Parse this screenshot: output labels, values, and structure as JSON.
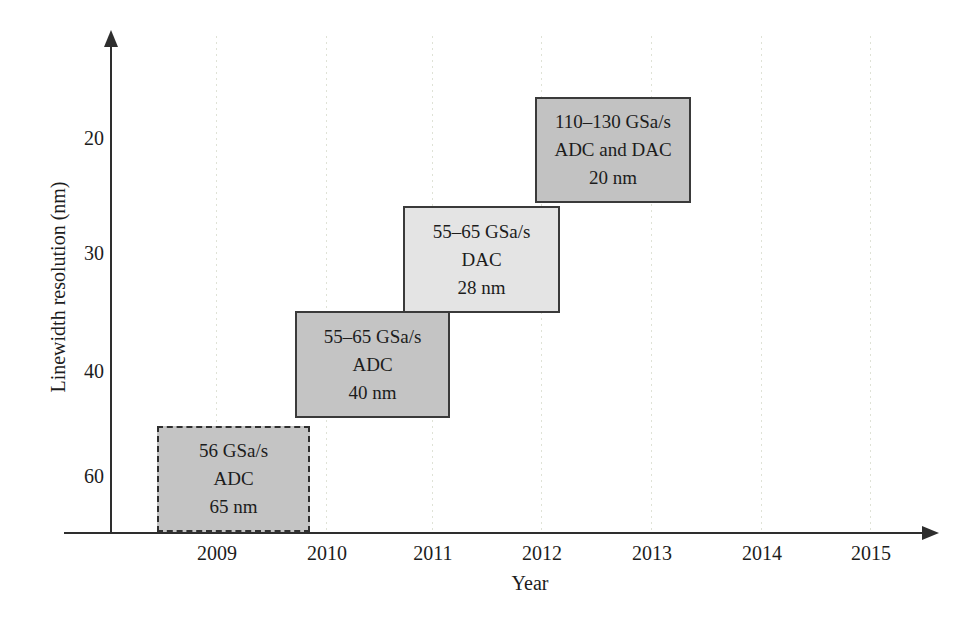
{
  "chart_data": {
    "type": "bar",
    "variant": "technology-roadmap-boxes",
    "title": "",
    "xlabel": "Year",
    "ylabel": "Linewidth resolution (nm)",
    "x_ticks": [
      "2009",
      "2010",
      "2011",
      "2012",
      "2013",
      "2014",
      "2015"
    ],
    "y_ticks": [
      "20",
      "30",
      "40",
      "60"
    ],
    "x_range": [
      2008.1,
      2015.6
    ],
    "y_axis_inverted": true,
    "grid": "faint dotted vertical gridline at each year tick",
    "boxes": [
      {
        "label_lines": [
          "56 GSa/s",
          "ADC",
          "65 nm"
        ],
        "sample_rate": "56 GSa/s",
        "converter": "ADC",
        "cmos_node_nm": 65,
        "year_span": [
          2008.45,
          2009.85
        ],
        "linewidth_span_nm": [
          45,
          66
        ],
        "border_style": "dashed",
        "fill": "#c4c4c4"
      },
      {
        "label_lines": [
          "55–65 GSa/s",
          "ADC",
          "40 nm"
        ],
        "sample_rate": "55–65 GSa/s",
        "converter": "ADC",
        "cmos_node_nm": 40,
        "year_span": [
          2009.7,
          2011.1
        ],
        "linewidth_span_nm": [
          35,
          44
        ],
        "border_style": "solid",
        "fill": "#c4c4c4"
      },
      {
        "label_lines": [
          "55–65 GSa/s",
          "DAC",
          "28 nm"
        ],
        "sample_rate": "55–65 GSa/s",
        "converter": "DAC",
        "cmos_node_nm": 28,
        "year_span": [
          2010.7,
          2012.15
        ],
        "linewidth_span_nm": [
          26,
          35
        ],
        "border_style": "solid",
        "fill": "#e4e4e4"
      },
      {
        "label_lines": [
          "110–130 GSa/s",
          "ADC and DAC",
          "20 nm"
        ],
        "sample_rate": "110–130 GSa/s",
        "converter": "ADC and DAC",
        "cmos_node_nm": 20,
        "year_span": [
          2011.9,
          2013.3
        ],
        "linewidth_span_nm": [
          16,
          25.5
        ],
        "border_style": "solid",
        "fill": "#c2c2c2"
      }
    ],
    "colors": {
      "box_fill_dark": "#c4c4c4",
      "box_fill_light": "#e4e4e4",
      "box_border": "#3a3a3a",
      "axis": "#2e2e2e",
      "text": "#1c1c1c",
      "gridline": "#dfe2d6",
      "background": "#ffffff"
    }
  }
}
